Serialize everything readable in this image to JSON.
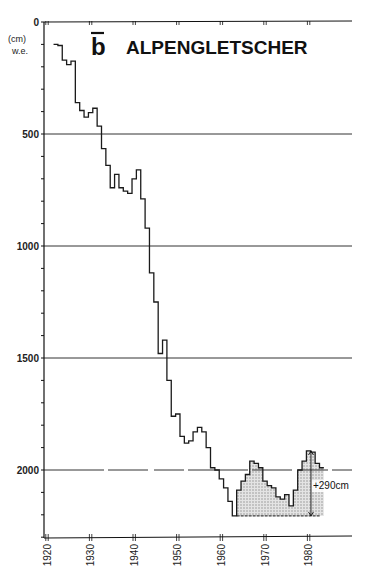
{
  "chart_data": {
    "type": "line",
    "style": "step",
    "title": "ALPENGLETSCHER",
    "title_symbol": "b",
    "xlabel": "",
    "ylabel": "(cm) w.e.",
    "ylabel_line1": "(cm)",
    "ylabel_line2": "w.e.",
    "y_inverted": true,
    "xlim": [
      1920,
      1990
    ],
    "ylim": [
      0,
      2300
    ],
    "x_ticks": [
      1920,
      1930,
      1940,
      1950,
      1960,
      1970,
      1980
    ],
    "x_tick_labels": [
      "1920",
      "1930",
      "1940",
      "1950",
      "1960",
      "1970",
      "1980"
    ],
    "y_ticks": [
      0,
      500,
      1000,
      1500,
      2000
    ],
    "y_tick_labels": [
      "0",
      "500",
      "1000",
      "1500",
      "2000"
    ],
    "y_minor_step": 100,
    "gridlines_y": [
      500,
      1000,
      1500,
      2000
    ],
    "grid": true,
    "annotation": {
      "text": "+290cm",
      "from_year": 1963,
      "to_year": 1983,
      "min_value": 2205,
      "shaded_region": "1963-1983 recovery above minimum"
    },
    "series": [
      {
        "name": "Cumulative mass balance",
        "x": [
          1922,
          1923,
          1924,
          1925,
          1926,
          1927,
          1928,
          1929,
          1930,
          1931,
          1932,
          1933,
          1934,
          1935,
          1936,
          1937,
          1938,
          1939,
          1940,
          1941,
          1942,
          1943,
          1944,
          1945,
          1946,
          1947,
          1948,
          1949,
          1950,
          1951,
          1952,
          1953,
          1954,
          1955,
          1956,
          1957,
          1958,
          1959,
          1960,
          1961,
          1962,
          1963,
          1964,
          1965,
          1966,
          1967,
          1968,
          1969,
          1970,
          1971,
          1972,
          1973,
          1974,
          1975,
          1976,
          1977,
          1978,
          1979,
          1980,
          1981,
          1982,
          1983
        ],
        "values": [
          100,
          105,
          170,
          190,
          175,
          360,
          395,
          425,
          405,
          385,
          465,
          565,
          640,
          740,
          680,
          740,
          755,
          765,
          700,
          660,
          790,
          920,
          1120,
          1250,
          1480,
          1420,
          1600,
          1760,
          1750,
          1850,
          1880,
          1870,
          1830,
          1810,
          1830,
          1900,
          1990,
          2000,
          2040,
          2080,
          2140,
          2205,
          2090,
          2050,
          2020,
          1960,
          1970,
          1990,
          2050,
          2070,
          2080,
          2120,
          2130,
          2110,
          2160,
          2090,
          2000,
          1960,
          1915,
          1920,
          1970,
          1990
        ]
      }
    ]
  },
  "colors": {
    "line": "#1a1a1a",
    "grid": "#333333",
    "shade": "#c8c8c8",
    "background": "#ffffff"
  }
}
